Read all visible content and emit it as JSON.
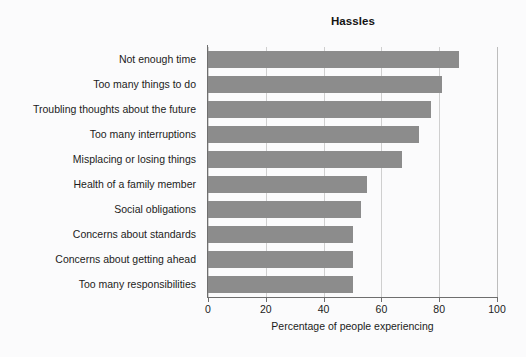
{
  "chart_data": {
    "type": "bar",
    "orientation": "horizontal",
    "title": "Hassles",
    "xlabel": "Percentage of people experiencing",
    "ylabel": "",
    "xlim": [
      0,
      100
    ],
    "xticks": [
      0,
      20,
      40,
      60,
      80,
      100
    ],
    "xtick_labels": [
      "0",
      "20",
      "40",
      "60",
      "80",
      "100"
    ],
    "grid": true,
    "grid_axis": "x",
    "legend": false,
    "bar_color": "#8c8c8c",
    "background_color": "#fbfbfc",
    "axis_color": "#6e6e6e",
    "categories": [
      "Not enough time",
      "Too many things to do",
      "Troubling thoughts about the future",
      "Too many interruptions",
      "Misplacing or losing things",
      "Health of a family member",
      "Social obligations",
      "Concerns about standards",
      "Concerns about getting ahead",
      "Too many responsibilities"
    ],
    "values": [
      87,
      81,
      77,
      73,
      67,
      55,
      53,
      50,
      50,
      50
    ]
  }
}
